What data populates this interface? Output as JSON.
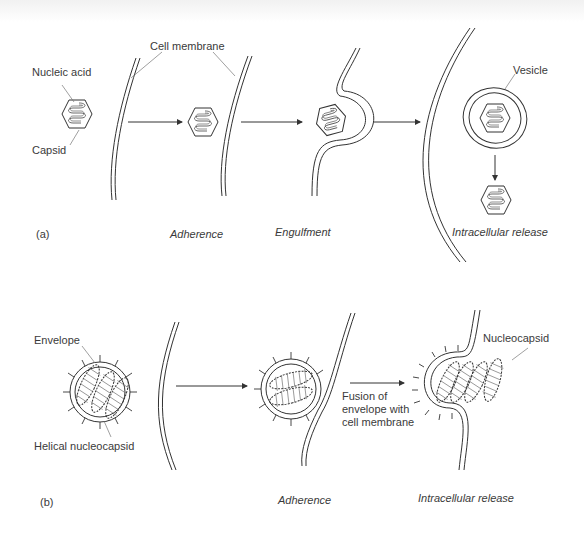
{
  "panel_a": {
    "tag": "(a)",
    "labels": {
      "nucleic_acid": "Nucleic acid",
      "capsid": "Capsid",
      "cell_membrane": "Cell membrane",
      "vesicle": "Vesicle"
    },
    "stages": [
      "Adherence",
      "Engulfment",
      "Intracellular release"
    ]
  },
  "panel_b": {
    "tag": "(b)",
    "labels": {
      "envelope": "Envelope",
      "helical_nucleocapsid": "Helical nucleocapsid",
      "nucleocapsid": "Nucleocapsid",
      "fusion": "Fusion of\nenvelope with\ncell membrane"
    },
    "stages": [
      "Adherence",
      "Intracellular release"
    ]
  },
  "colors": {
    "line": "#333333",
    "leader": "#777777",
    "background": "#ffffff"
  }
}
